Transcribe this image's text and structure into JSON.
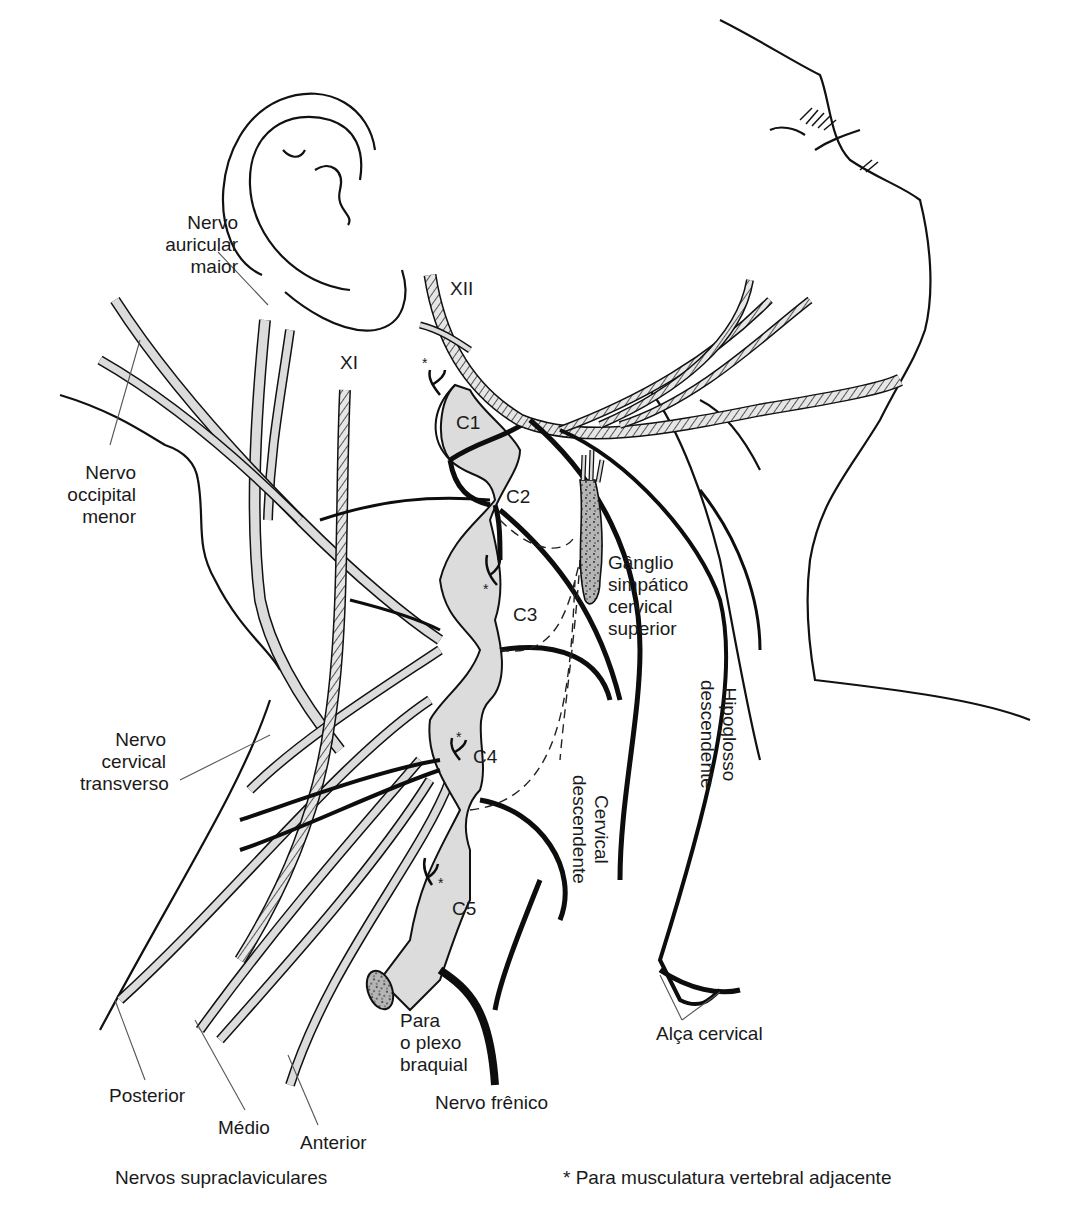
{
  "figure": {
    "colors": {
      "outline": "#111111",
      "nerve_fill_light": "#dcdcdc",
      "nerve_fill_dark": "#0d0d0d",
      "hatched_nerve": "#8a8a8a",
      "ganglion": "#9a9a9a",
      "background": "#ffffff"
    }
  },
  "labels": {
    "auricular_maior": [
      "Nervo",
      "auricular",
      "maior"
    ],
    "occipital_menor": [
      "Nervo",
      "occipital",
      "menor"
    ],
    "cervical_transverso": [
      "Nervo",
      "cervical",
      "transverso"
    ],
    "ganglio": [
      "Gânglio",
      "simpático",
      "cervical",
      "superior"
    ],
    "hipoglosso_descendente": [
      "Hipoglosso",
      "descendente"
    ],
    "cervical_descendente": [
      "Cervical",
      "descendente"
    ],
    "plexo_braquial": [
      "Para",
      "o plexo",
      "braquial"
    ],
    "nervo_frenico": "Nervo frênico",
    "alca_cervical": "Alça cervical",
    "posterior": "Posterior",
    "medio": "Médio",
    "anterior": "Anterior",
    "supraclaviculares": "Nervos supraclaviculares",
    "footnote": "* Para musculatura vertebral adjacente",
    "xii": "XII",
    "xi": "XI",
    "c1": "C1",
    "c2": "C2",
    "c3": "C3",
    "c4": "C4",
    "c5": "C5",
    "asterisk": "*"
  }
}
